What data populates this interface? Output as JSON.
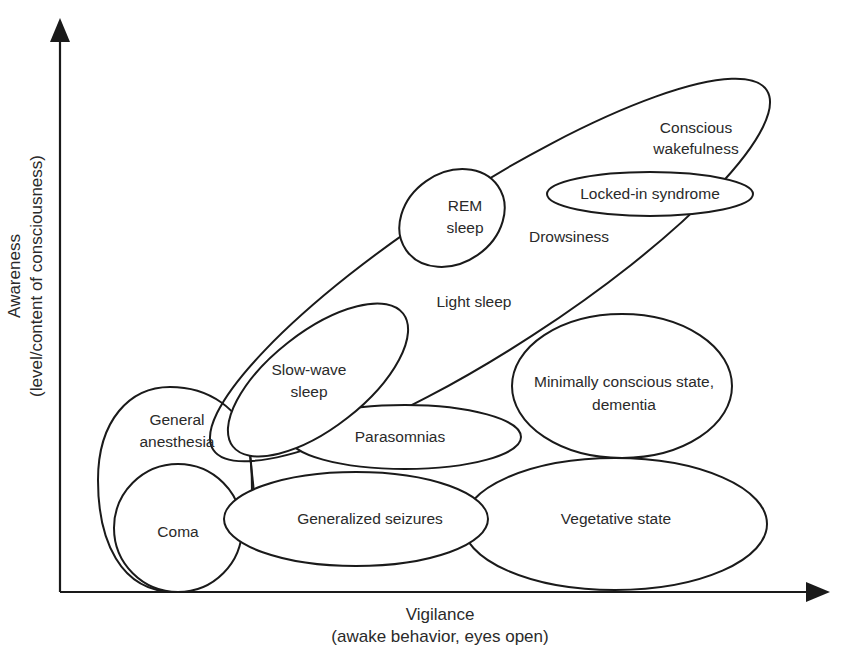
{
  "diagram": {
    "title": "",
    "x_axis": {
      "label": "Vigilance",
      "sublabel": "(awake behavior, eyes open)"
    },
    "y_axis": {
      "label": "Awareness",
      "sublabel": "(level/content of consciousness)"
    },
    "regions": [
      {
        "id": "conscious-wakefulness",
        "line1": "Conscious",
        "line2": "wakefulness"
      },
      {
        "id": "locked-in-syndrome",
        "line1": "Locked-in syndrome"
      },
      {
        "id": "rem-sleep",
        "line1": "REM",
        "line2": "sleep"
      },
      {
        "id": "drowsiness",
        "line1": "Drowsiness"
      },
      {
        "id": "light-sleep",
        "line1": "Light sleep"
      },
      {
        "id": "slow-wave-sleep",
        "line1": "Slow-wave",
        "line2": "sleep"
      },
      {
        "id": "general-anesthesia",
        "line1": "General",
        "line2": "anesthesia"
      },
      {
        "id": "parasomnias",
        "line1": "Parasomnias"
      },
      {
        "id": "minimally-conscious-state",
        "line1": "Minimally conscious state,",
        "line2": "dementia"
      },
      {
        "id": "coma",
        "line1": "Coma"
      },
      {
        "id": "generalized-seizures",
        "line1": "Generalized seizures"
      },
      {
        "id": "vegetative-state",
        "line1": "Vegetative state"
      }
    ]
  }
}
